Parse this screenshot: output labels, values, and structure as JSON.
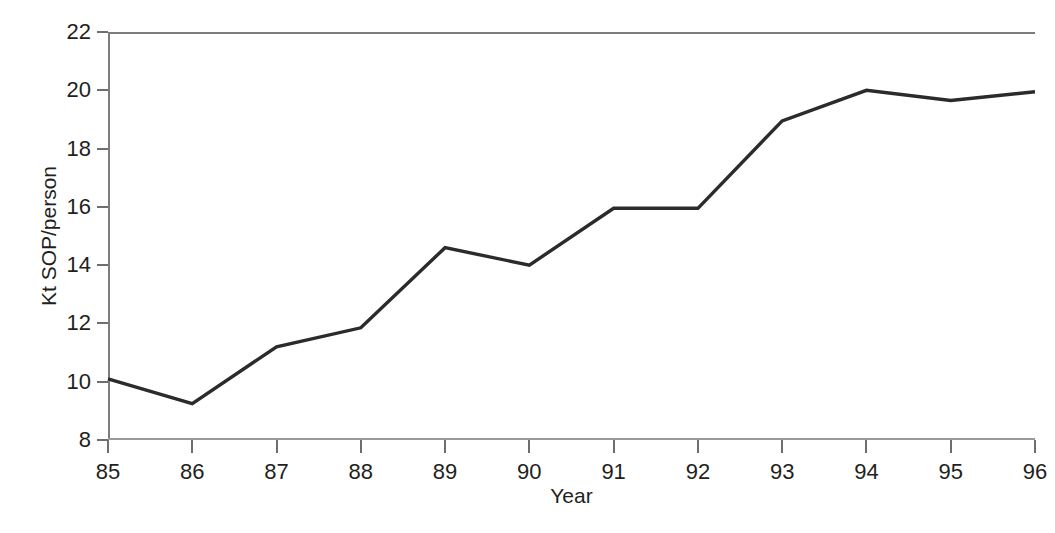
{
  "chart_data": {
    "type": "line",
    "title": "",
    "subtitle": "",
    "xlabel": "Year",
    "ylabel": "Kt SOP/person",
    "x": [
      85,
      86,
      87,
      88,
      89,
      90,
      91,
      92,
      93,
      94,
      95,
      96
    ],
    "categories": [
      "85",
      "86",
      "87",
      "88",
      "89",
      "90",
      "91",
      "92",
      "93",
      "94",
      "95",
      "96"
    ],
    "values": [
      10.1,
      9.25,
      11.2,
      11.85,
      14.6,
      14.0,
      15.95,
      15.95,
      18.95,
      20.0,
      19.65,
      19.95
    ],
    "series": [
      {
        "name": "Kt SOP/person",
        "values": [
          10.1,
          9.25,
          11.2,
          11.85,
          14.6,
          14.0,
          15.95,
          15.95,
          18.95,
          20.0,
          19.65,
          19.95
        ],
        "color": "#2b2b2b"
      }
    ],
    "xlim": [
      85,
      96
    ],
    "ylim": [
      8,
      22
    ],
    "yticks": [
      8,
      10,
      12,
      14,
      16,
      18,
      20,
      22
    ],
    "ytick_labels": [
      "8",
      "10",
      "12",
      "14",
      "16",
      "18",
      "20",
      "22"
    ],
    "xticks": [
      85,
      86,
      87,
      88,
      89,
      90,
      91,
      92,
      93,
      94,
      95,
      96
    ],
    "xtick_labels": [
      "85",
      "86",
      "87",
      "88",
      "89",
      "90",
      "91",
      "92",
      "93",
      "94",
      "95",
      "96"
    ],
    "grid": false,
    "legend": false,
    "legend_position": "none",
    "annotations": [],
    "colors": {
      "line": "#2b2b2b",
      "axis": "#7d7d7d",
      "text": "#231f20",
      "background": "#ffffff"
    }
  }
}
